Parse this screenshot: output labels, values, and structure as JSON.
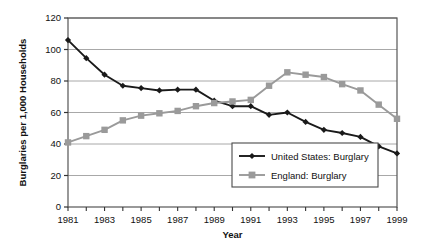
{
  "chart_data": {
    "type": "line",
    "title": "",
    "xlabel": "Year",
    "ylabel": "Burglaries per 1,000 Households",
    "x": [
      1981,
      1982,
      1983,
      1984,
      1985,
      1986,
      1987,
      1988,
      1989,
      1990,
      1991,
      1992,
      1993,
      1994,
      1995,
      1996,
      1997,
      1998,
      1999
    ],
    "xlim": [
      1981,
      1999
    ],
    "ylim": [
      0,
      120
    ],
    "yticks": [
      0,
      20,
      40,
      60,
      80,
      100,
      120
    ],
    "ytick_labels": [
      "0",
      "20",
      "40",
      "60",
      "80",
      "100",
      "120"
    ],
    "xticks": [
      1981,
      1983,
      1985,
      1987,
      1989,
      1991,
      1993,
      1995,
      1997,
      1999
    ],
    "xtick_labels": [
      "1981",
      "1983",
      "1985",
      "1987",
      "1989",
      "1991",
      "1993",
      "1995",
      "1997",
      "1999"
    ],
    "grid": "horizontal",
    "legend_position": "lower-right",
    "series": [
      {
        "name": "United States: Burglary",
        "color": "#1a1a1a",
        "marker": "diamond",
        "values": [
          106,
          94.5,
          84,
          77,
          75.5,
          74,
          74.5,
          74.5,
          67.5,
          64,
          64,
          58.5,
          60,
          54,
          49,
          47,
          44.5,
          38.5,
          34
        ]
      },
      {
        "name": "England: Burglary",
        "color": "#9a9a9a",
        "marker": "square",
        "values": [
          41,
          45,
          49,
          55,
          58,
          59.5,
          61,
          64,
          66,
          67,
          68,
          77,
          85.5,
          84,
          82.5,
          78,
          74,
          65,
          56
        ]
      }
    ]
  },
  "legend": {
    "entries": [
      {
        "label": "United States: Burglary"
      },
      {
        "label": "England: Burglary"
      }
    ]
  },
  "axes": {
    "y_title": "Burglaries per 1,000 Households",
    "x_title": "Year"
  }
}
